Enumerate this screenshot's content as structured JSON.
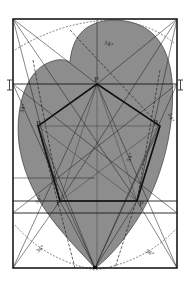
{
  "figure": {
    "type": "geometric-construction",
    "colors": {
      "background": "#ffffff",
      "shade": "#8d8d8d",
      "ink": "#1a1a1a"
    },
    "frame": {
      "x": 13,
      "y": 19,
      "width": 164,
      "height": 249
    },
    "vertex_labels": [
      {
        "id": "top",
        "text": "P",
        "x": 94,
        "y": 82
      },
      {
        "id": "right",
        "text": "P",
        "x": 153,
        "y": 125
      },
      {
        "id": "bottom-right",
        "text": "P",
        "x": 139,
        "y": 206
      },
      {
        "id": "bottom-left",
        "text": "P",
        "x": 56,
        "y": 205
      },
      {
        "id": "left",
        "text": "P",
        "x": 36,
        "y": 126
      }
    ],
    "angle_labels": [
      {
        "text": "36°",
        "x": 38,
        "y": 253,
        "rotate": -40
      },
      {
        "text": "36°",
        "x": 145,
        "y": 252,
        "rotate": 30
      },
      {
        "text": "54°",
        "x": 104,
        "y": 44,
        "rotate": 20
      },
      {
        "text": "54°",
        "x": 23,
        "y": 113,
        "rotate": -70
      },
      {
        "text": "54°",
        "x": 168,
        "y": 114,
        "rotate": 70
      },
      {
        "text": "54°",
        "x": 38,
        "y": 204,
        "rotate": -60
      },
      {
        "text": "54°",
        "x": 130,
        "y": 162,
        "rotate": -70
      }
    ],
    "side_marks": [
      {
        "text": "I",
        "x": 9,
        "y": 86
      },
      {
        "text": "I",
        "x": 181,
        "y": 86
      }
    ]
  }
}
